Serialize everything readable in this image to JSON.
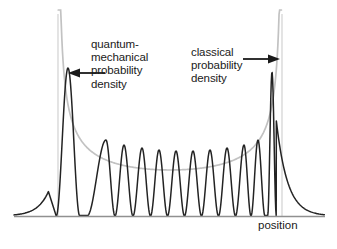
{
  "figure": {
    "title": "",
    "background_color": "#ffffff",
    "width": 337,
    "height": 249,
    "axis": {
      "xlabel": "position",
      "ylabel": "",
      "baseline_color": "#8c8c8c",
      "baseline_y": 216,
      "x_start": 14,
      "x_end": 325
    },
    "well_boundaries": {
      "color": "#d6d6d6",
      "left_x": 58,
      "right_x": 282,
      "top_y": 14,
      "bottom_y": 216
    },
    "annotations": [
      {
        "name": "quantum-label",
        "lines": [
          "quantum-",
          "mechanical",
          "probability",
          "density"
        ],
        "text": "quantum-\nmechanical\nprobability\ndensity",
        "arrow_direction": "left",
        "arrow_color": "#1a1a1a",
        "arrow_from_x": 105,
        "arrow_to_x": 70,
        "arrow_y": 73
      },
      {
        "name": "classical-label",
        "lines": [
          "classical",
          "probability",
          "density"
        ],
        "text": "classical\nprobability\ndensity",
        "arrow_direction": "right",
        "arrow_color": "#1a1a1a",
        "arrow_from_x": 243,
        "arrow_to_x": 279,
        "arrow_y": 59
      }
    ]
  },
  "chart_data": {
    "type": "line",
    "title": "",
    "xlabel": "position",
    "ylabel": "",
    "xlim": [
      0,
      1
    ],
    "ylim": [
      0,
      1
    ],
    "grid": false,
    "legend": "inline-annotations",
    "series": [
      {
        "name": "quantum-mechanical probability density",
        "color": "#1a1a1a",
        "width": 1.6,
        "description": "Highly oscillatory |psi|^2 for a high quantum number state in a potential well; amplitude envelope rises sharply near the classical turning points at the well edges, producing two tall edge peaks and decaying tails outside the well.",
        "peak_count_interior": 12,
        "edge_peak_left_x": 68,
        "edge_peak_left_y": 68,
        "edge_peak_right_x": 272,
        "edge_peak_right_y": 72,
        "interior_peak_tops_y": [
          131,
          140,
          145,
          148,
          150,
          151,
          151,
          150,
          148,
          145,
          140,
          131
        ],
        "interior_peak_centers_x": [
          88,
          106,
          124,
          142,
          159,
          176,
          193,
          210,
          227,
          244,
          258,
          272
        ],
        "trough_y": 215
      },
      {
        "name": "classical probability density",
        "color": "#bdbdbd",
        "width": 1.6,
        "description": "Smooth U-shaped classical distribution 1/sqrt of velocity; diverges at both turning points (well walls) and is minimum at the center of the well.",
        "min_y": 170,
        "min_x": 170,
        "left_divergence_x": 58,
        "right_divergence_x": 282
      }
    ]
  }
}
